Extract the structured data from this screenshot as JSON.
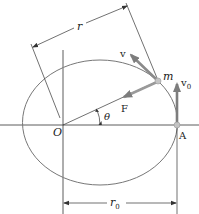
{
  "diagram": {
    "type": "orbital-mechanics",
    "labels": {
      "r": "r",
      "v": "v",
      "m": "m",
      "v0": "v",
      "v0_sub": "0",
      "F": "F",
      "O": "O",
      "theta": "θ",
      "A": "A",
      "r0": "r",
      "r0_sub": "0"
    },
    "colors": {
      "line": "#333333",
      "ellipse": "#777777",
      "arrow": "#8a8a8a",
      "point": "#bbbbbb"
    }
  }
}
